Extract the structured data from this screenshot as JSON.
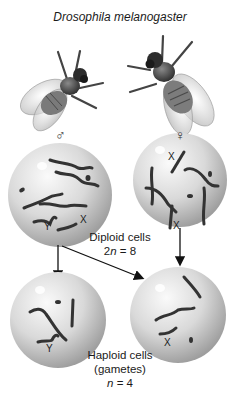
{
  "title": "Drosophila melanogaster",
  "flies": {
    "male": {
      "symbol": "♂",
      "icon": "male-fly-icon"
    },
    "female": {
      "symbol": "♀",
      "icon": "female-fly-icon"
    }
  },
  "diploid": {
    "label_line1": "Diploid cells",
    "label_n_prefix": "2",
    "label_n_var": "n",
    "label_n_suffix": " = 8",
    "male_cell": {
      "sex_chromosome_labels": [
        "Y",
        "X"
      ]
    },
    "female_cell": {
      "sex_chromosome_labels": [
        "X",
        "X"
      ]
    }
  },
  "haploid": {
    "label_line1": "Haploid cells",
    "label_line2": "(gametes)",
    "label_n_var": "n",
    "label_n_suffix": " = 4",
    "left_cell": {
      "sex_chromosome_label": "Y"
    },
    "right_cell": {
      "sex_chromosome_label": "X"
    }
  },
  "colors": {
    "cell_fill_center": "#f2f2f2",
    "cell_fill_edge": "#a9a9a9",
    "chromosome": "#3a3a3a",
    "arrow": "#111111"
  }
}
